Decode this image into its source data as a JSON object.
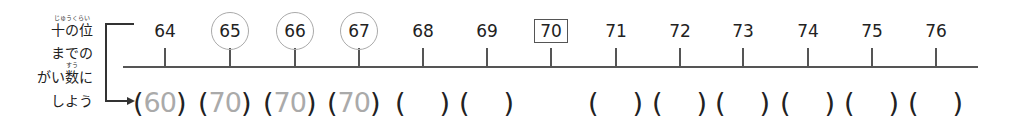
{
  "instruction": {
    "line1": "十の位",
    "line1_ruby": "じゅうくらい",
    "line2": "までの",
    "line3_pre": "がい",
    "line3_kanji": "数",
    "line3_kanji_ruby": "すう",
    "line3_post": "に",
    "line4": "しよう"
  },
  "number_line": {
    "ticks": [
      {
        "label": "64",
        "style": "plain",
        "x": 165
      },
      {
        "label": "65",
        "style": "circled",
        "x": 230
      },
      {
        "label": "66",
        "style": "circled",
        "x": 295
      },
      {
        "label": "67",
        "style": "circled",
        "x": 359
      },
      {
        "label": "68",
        "style": "plain",
        "x": 423
      },
      {
        "label": "69",
        "style": "plain",
        "x": 487
      },
      {
        "label": "70",
        "style": "boxed",
        "x": 551
      },
      {
        "label": "71",
        "style": "plain",
        "x": 616
      },
      {
        "label": "72",
        "style": "plain",
        "x": 680
      },
      {
        "label": "73",
        "style": "plain",
        "x": 743
      },
      {
        "label": "74",
        "style": "plain",
        "x": 808
      },
      {
        "label": "75",
        "style": "plain",
        "x": 872
      },
      {
        "label": "76",
        "style": "plain",
        "x": 936
      }
    ]
  },
  "answers": [
    {
      "for": "64",
      "value": "60"
    },
    {
      "for": "65",
      "value": "70"
    },
    {
      "for": "66",
      "value": "70"
    },
    {
      "for": "67",
      "value": "70"
    },
    {
      "for": "68",
      "value": ""
    },
    {
      "for": "69",
      "value": ""
    },
    {
      "for": "71",
      "value": ""
    },
    {
      "for": "72",
      "value": ""
    },
    {
      "for": "73",
      "value": ""
    },
    {
      "for": "74",
      "value": ""
    },
    {
      "for": "75",
      "value": ""
    },
    {
      "for": "76",
      "value": ""
    }
  ],
  "paren_open": "(",
  "paren_close": ")",
  "colors": {
    "text": "#222222",
    "answer_hint": "#aaaaaa",
    "circle_outline": "#aaaaaa",
    "line": "#555555"
  }
}
